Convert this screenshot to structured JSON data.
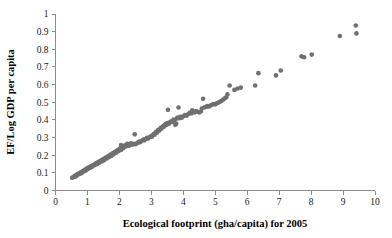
{
  "chart_data": {
    "type": "scatter",
    "title": "",
    "xlabel": "Ecological footprint (gha/capita) for 2005",
    "ylabel": "EF/Log GDP per capita",
    "xlim": [
      0,
      10
    ],
    "ylim": [
      0,
      1
    ],
    "grid": false,
    "legend": false,
    "marker": {
      "shape": "circle",
      "color": "#707070",
      "size_px": 4.6
    },
    "axis_color": "#8c8c8c",
    "xticks": [
      "0",
      "1",
      "2",
      "3",
      "4",
      "5",
      "6",
      "7",
      "8",
      "9",
      "10"
    ],
    "xtick_values": [
      0,
      1,
      2,
      3,
      4,
      5,
      6,
      7,
      8,
      9,
      10
    ],
    "yticks": [
      "0",
      "0.1",
      "0.2",
      "0.3",
      "0.4",
      "0.5",
      "0.6",
      "0.7",
      "0.8",
      "0.9",
      "1"
    ],
    "ytick_values": [
      0,
      0.1,
      0.2,
      0.3,
      0.4,
      0.5,
      0.6,
      0.7,
      0.8,
      0.9,
      1
    ],
    "series": [
      {
        "name": "Countries",
        "points": [
          [
            0.52,
            0.072
          ],
          [
            0.55,
            0.075
          ],
          [
            0.58,
            0.078
          ],
          [
            0.6,
            0.082
          ],
          [
            0.62,
            0.085
          ],
          [
            0.64,
            0.08
          ],
          [
            0.66,
            0.088
          ],
          [
            0.68,
            0.092
          ],
          [
            0.7,
            0.09
          ],
          [
            0.72,
            0.095
          ],
          [
            0.74,
            0.098
          ],
          [
            0.76,
            0.094
          ],
          [
            0.78,
            0.1
          ],
          [
            0.8,
            0.103
          ],
          [
            0.82,
            0.099
          ],
          [
            0.84,
            0.106
          ],
          [
            0.86,
            0.11
          ],
          [
            0.88,
            0.108
          ],
          [
            0.9,
            0.113
          ],
          [
            0.92,
            0.117
          ],
          [
            0.94,
            0.112
          ],
          [
            0.96,
            0.12
          ],
          [
            0.98,
            0.124
          ],
          [
            1.0,
            0.121
          ],
          [
            1.02,
            0.127
          ],
          [
            1.05,
            0.131
          ],
          [
            1.07,
            0.128
          ],
          [
            1.1,
            0.135
          ],
          [
            1.12,
            0.139
          ],
          [
            1.14,
            0.134
          ],
          [
            1.17,
            0.142
          ],
          [
            1.2,
            0.146
          ],
          [
            1.22,
            0.143
          ],
          [
            1.25,
            0.15
          ],
          [
            1.27,
            0.154
          ],
          [
            1.3,
            0.149
          ],
          [
            1.32,
            0.158
          ],
          [
            1.35,
            0.162
          ],
          [
            1.37,
            0.157
          ],
          [
            1.4,
            0.166
          ],
          [
            1.42,
            0.17
          ],
          [
            1.45,
            0.165
          ],
          [
            1.47,
            0.174
          ],
          [
            1.5,
            0.178
          ],
          [
            1.52,
            0.172
          ],
          [
            1.55,
            0.182
          ],
          [
            1.58,
            0.186
          ],
          [
            1.6,
            0.181
          ],
          [
            1.62,
            0.19
          ],
          [
            1.65,
            0.194
          ],
          [
            1.67,
            0.188
          ],
          [
            1.7,
            0.198
          ],
          [
            1.72,
            0.203
          ],
          [
            1.75,
            0.196
          ],
          [
            1.78,
            0.207
          ],
          [
            1.8,
            0.212
          ],
          [
            1.82,
            0.205
          ],
          [
            1.85,
            0.216
          ],
          [
            1.88,
            0.22
          ],
          [
            1.9,
            0.214
          ],
          [
            1.92,
            0.224
          ],
          [
            1.95,
            0.229
          ],
          [
            1.97,
            0.222
          ],
          [
            2.0,
            0.233
          ],
          [
            2.02,
            0.238
          ],
          [
            2.05,
            0.23
          ],
          [
            2.05,
            0.258
          ],
          [
            2.08,
            0.242
          ],
          [
            2.1,
            0.247
          ],
          [
            2.12,
            0.24
          ],
          [
            2.15,
            0.251
          ],
          [
            2.18,
            0.256
          ],
          [
            2.2,
            0.249
          ],
          [
            2.22,
            0.26
          ],
          [
            2.25,
            0.265
          ],
          [
            2.28,
            0.258
          ],
          [
            2.3,
            0.254
          ],
          [
            2.33,
            0.262
          ],
          [
            2.36,
            0.268
          ],
          [
            2.4,
            0.259
          ],
          [
            2.45,
            0.265
          ],
          [
            2.48,
            0.318
          ],
          [
            2.5,
            0.262
          ],
          [
            2.55,
            0.268
          ],
          [
            2.58,
            0.272
          ],
          [
            2.62,
            0.278
          ],
          [
            2.65,
            0.274
          ],
          [
            2.7,
            0.282
          ],
          [
            2.75,
            0.288
          ],
          [
            2.78,
            0.284
          ],
          [
            2.82,
            0.292
          ],
          [
            2.86,
            0.298
          ],
          [
            2.9,
            0.294
          ],
          [
            2.95,
            0.303
          ],
          [
            3.0,
            0.309
          ],
          [
            3.02,
            0.305
          ],
          [
            3.05,
            0.314
          ],
          [
            3.08,
            0.32
          ],
          [
            3.1,
            0.316
          ],
          [
            3.12,
            0.326
          ],
          [
            3.15,
            0.332
          ],
          [
            3.18,
            0.328
          ],
          [
            3.2,
            0.338
          ],
          [
            3.22,
            0.344
          ],
          [
            3.25,
            0.34
          ],
          [
            3.28,
            0.349
          ],
          [
            3.3,
            0.355
          ],
          [
            3.32,
            0.351
          ],
          [
            3.35,
            0.36
          ],
          [
            3.38,
            0.366
          ],
          [
            3.4,
            0.362
          ],
          [
            3.42,
            0.371
          ],
          [
            3.45,
            0.377
          ],
          [
            3.48,
            0.373
          ],
          [
            3.5,
            0.382
          ],
          [
            3.52,
            0.457
          ],
          [
            3.55,
            0.378
          ],
          [
            3.58,
            0.386
          ],
          [
            3.62,
            0.392
          ],
          [
            3.65,
            0.388
          ],
          [
            3.68,
            0.396
          ],
          [
            3.7,
            0.402
          ],
          [
            3.72,
            0.398
          ],
          [
            3.75,
            0.372
          ],
          [
            3.78,
            0.38
          ],
          [
            3.8,
            0.408
          ],
          [
            3.82,
            0.414
          ],
          [
            3.85,
            0.47
          ],
          [
            3.88,
            0.41
          ],
          [
            3.9,
            0.418
          ],
          [
            3.95,
            0.412
          ],
          [
            4.0,
            0.42
          ],
          [
            4.05,
            0.428
          ],
          [
            4.1,
            0.424
          ],
          [
            4.15,
            0.432
          ],
          [
            4.2,
            0.44
          ],
          [
            4.25,
            0.436
          ],
          [
            4.28,
            0.455
          ],
          [
            4.3,
            0.446
          ],
          [
            4.35,
            0.442
          ],
          [
            4.4,
            0.45
          ],
          [
            4.45,
            0.446
          ],
          [
            4.5,
            0.442
          ],
          [
            4.55,
            0.448
          ],
          [
            4.58,
            0.465
          ],
          [
            4.62,
            0.52
          ],
          [
            4.65,
            0.47
          ],
          [
            4.7,
            0.473
          ],
          [
            4.75,
            0.478
          ],
          [
            4.8,
            0.476
          ],
          [
            4.85,
            0.482
          ],
          [
            4.9,
            0.486
          ],
          [
            4.95,
            0.49
          ],
          [
            5.0,
            0.488
          ],
          [
            5.05,
            0.494
          ],
          [
            5.1,
            0.498
          ],
          [
            5.15,
            0.503
          ],
          [
            5.2,
            0.508
          ],
          [
            5.25,
            0.515
          ],
          [
            5.3,
            0.522
          ],
          [
            5.35,
            0.53
          ],
          [
            5.38,
            0.545
          ],
          [
            5.45,
            0.595
          ],
          [
            5.6,
            0.57
          ],
          [
            5.7,
            0.578
          ],
          [
            5.8,
            0.583
          ],
          [
            6.25,
            0.595
          ],
          [
            6.35,
            0.665
          ],
          [
            6.9,
            0.652
          ],
          [
            7.05,
            0.68
          ],
          [
            7.7,
            0.76
          ],
          [
            7.78,
            0.755
          ],
          [
            8.02,
            0.77
          ],
          [
            8.9,
            0.875
          ],
          [
            9.4,
            0.935
          ],
          [
            9.42,
            0.89
          ]
        ]
      }
    ]
  }
}
